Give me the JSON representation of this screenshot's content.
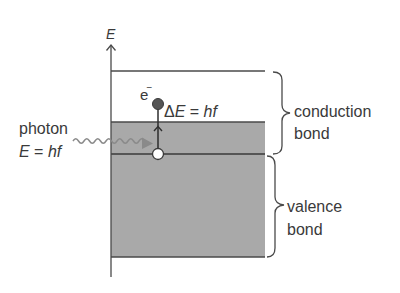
{
  "diagram": {
    "axis_label": "E",
    "photon": {
      "label": "photon",
      "energy_lhs": "E",
      "energy_eq": " = ",
      "energy_rhs": "hf"
    },
    "electron": {
      "symbol": "e",
      "charge": "−"
    },
    "transition": {
      "delta": "Δ",
      "lhs": "E",
      "eq": " = ",
      "rhs": "hf"
    },
    "bands": {
      "conduction": {
        "line1": "conduction",
        "line2": "bond"
      },
      "valence": {
        "line1": "valence",
        "line2": "bond"
      }
    },
    "colors": {
      "band_fill": "#a9a9a9",
      "line": "#4a4a4a",
      "photon_wave": "#8a8a8a",
      "electron": "#555555",
      "hole": "#ffffff"
    }
  }
}
